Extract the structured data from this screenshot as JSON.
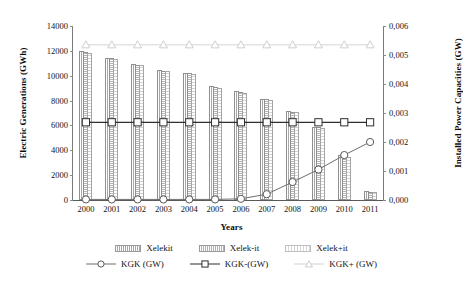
{
  "chart_data": {
    "type": "bar",
    "title": "",
    "xlabel": "Years",
    "ylabel": "Electric Generations (GWh)",
    "y2label": "Installed Power Capacities (GW)",
    "categories": [
      "2000",
      "2001",
      "2002",
      "2003",
      "2004",
      "2005",
      "2006",
      "2007",
      "2008",
      "2009",
      "2010",
      "2011"
    ],
    "ylim": [
      0,
      14000
    ],
    "y2lim": [
      0,
      0.006
    ],
    "yticks": [
      "0",
      "2000",
      "4000",
      "6000",
      "8000",
      "10000",
      "12000",
      "14000"
    ],
    "ytick_values": [
      0,
      2000,
      4000,
      6000,
      8000,
      10000,
      12000,
      14000
    ],
    "y2ticks": [
      "0,000",
      "0,001",
      "0,002",
      "0,003",
      "0,004",
      "0,005",
      "0,006"
    ],
    "y2tick_values": [
      0,
      0.001,
      0.002,
      0.003,
      0.004,
      0.005,
      0.006
    ],
    "grid": false,
    "legend_position": "bottom",
    "series": [
      {
        "name": "Xelekit",
        "kind": "bar",
        "axis": "left",
        "values": [
          11950,
          11450,
          10950,
          10450,
          10250,
          9150,
          8750,
          8150,
          7150,
          5900,
          3600,
          700
        ]
      },
      {
        "name": "Xelek-it",
        "kind": "bar",
        "axis": "left",
        "values": [
          11900,
          11400,
          10900,
          10400,
          10200,
          9100,
          8700,
          8100,
          7100,
          5850,
          3550,
          680
        ]
      },
      {
        "name": "Xelek+it",
        "kind": "bar",
        "axis": "left",
        "values": [
          11850,
          11350,
          10850,
          10350,
          10150,
          9050,
          8650,
          8050,
          7050,
          5800,
          3500,
          660
        ]
      },
      {
        "name": "KGK (GW)",
        "kind": "line",
        "axis": "right",
        "marker": "circle",
        "values": [
          2e-05,
          2e-05,
          2e-05,
          2e-05,
          2e-05,
          2e-05,
          4e-05,
          0.0002,
          0.00062,
          0.00105,
          0.00155,
          0.002
        ]
      },
      {
        "name": "KGK-(GW)",
        "kind": "line",
        "axis": "right",
        "marker": "square",
        "values": [
          0.00268,
          0.00268,
          0.00268,
          0.00268,
          0.00268,
          0.00268,
          0.00268,
          0.00268,
          0.00268,
          0.00268,
          0.00268,
          0.00268
        ]
      },
      {
        "name": "KGK+ (GW)",
        "kind": "line",
        "axis": "right",
        "marker": "triangle",
        "values": [
          0.00535,
          0.00535,
          0.00535,
          0.00535,
          0.00535,
          0.00535,
          0.00535,
          0.00535,
          0.00535,
          0.00535,
          0.00535,
          0.00535
        ]
      }
    ],
    "colors": {
      "bar_fill": "#c9c9c9",
      "bar_edge": "#8f8f8f",
      "line_kgk": "#6e6e6e",
      "line_kgk_minus": "#3a3a3a",
      "line_kgk_plus": "#d0d0d0",
      "axis": "#7a7a7a",
      "text": "#141414"
    }
  },
  "legend": {
    "row1": [
      "Xelekit",
      "Xelek-it",
      "Xelek+it"
    ],
    "row2": [
      "KGK (GW)",
      "KGK-(GW)",
      "KGK+ (GW)"
    ]
  }
}
